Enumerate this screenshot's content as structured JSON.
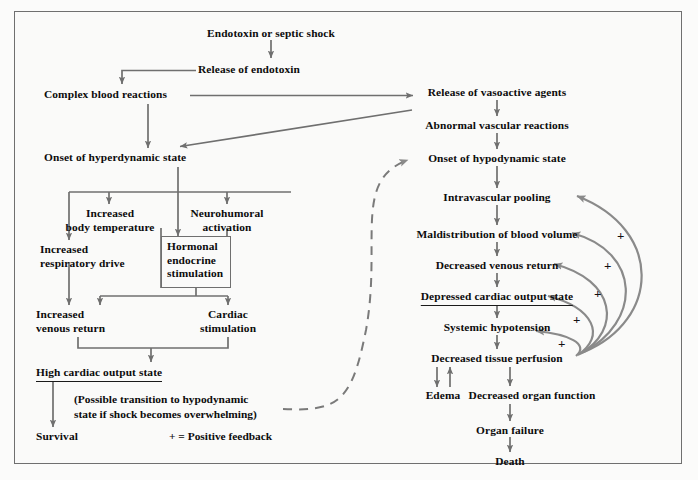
{
  "diagram": {
    "legend": "+ = Positive feedback",
    "note": "(Possible transition to hypodynamic\nstate if shock becomes overwhelming)",
    "colors": {
      "text": "#0c0c0c",
      "arrow": "#6f6f6f",
      "frame": "#6f6f6f",
      "background": "#fafaf9"
    },
    "nodes": {
      "endotoxin_shock": "Endotoxin or septic shock",
      "release_endotoxin": "Release of endotoxin",
      "complex_blood": "Complex blood reactions",
      "onset_hyper": "Onset of hyperdynamic state",
      "increased_body_temp": "Increased\nbody temperature",
      "neurohumoral": "Neurohumoral\nactivation",
      "increased_resp": "Increased\nrespiratory drive",
      "hormonal_endocrine": "Hormonal\nendocrine\nstimulation",
      "increased_venous": "Increased\nvenous return",
      "cardiac_stim": "Cardiac\nstimulation",
      "high_cardiac": "High cardiac output state",
      "survival": "Survival",
      "release_vasoactive": "Release of vasoactive agents",
      "abnormal_vascular": "Abnormal vascular reactions",
      "onset_hypo": "Onset of hypodynamic state",
      "intravascular_pooling": "Intravascular pooling",
      "maldistribution": "Maldistribution of blood volume",
      "decreased_venous": "Decreased venous return",
      "depressed_cardiac": "Depressed cardiac output state",
      "systemic_hypotension": "Systemic hypotension",
      "decreased_tissue": "Decreased tissue perfusion",
      "edema": "Edema",
      "decreased_organ": "Decreased organ function",
      "organ_failure": "Organ failure",
      "death": "Death"
    },
    "feedback_marks": [
      "+",
      "+",
      "+",
      "+",
      "+"
    ]
  }
}
